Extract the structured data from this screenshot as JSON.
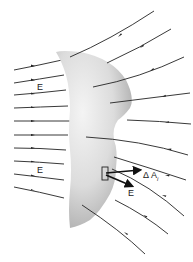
{
  "diagram": {
    "surface": {
      "fill_light": "#f2f2f2",
      "fill_dark": "#b9b9b9"
    },
    "field_line_color": "#222222",
    "labels": {
      "field_upper": "E",
      "field_lower": "E",
      "area_element": "Δ A",
      "area_subscript": "i",
      "field_at_element": "E"
    },
    "vectors": [
      {
        "name": "area-vector",
        "label": "ΔAᵢ",
        "direction": "normal to surface element"
      },
      {
        "name": "field-vector",
        "label": "E",
        "direction": "along field line"
      }
    ]
  }
}
